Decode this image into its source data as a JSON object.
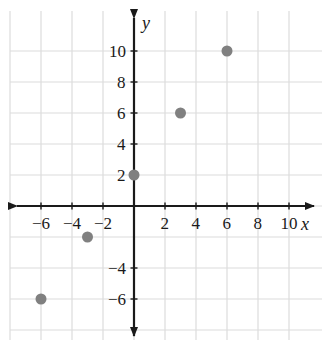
{
  "chart_data": {
    "type": "scatter",
    "title": "",
    "xlabel": "x",
    "ylabel": "y",
    "grid": true,
    "grid_step": 2,
    "legend": "none",
    "xlim": [
      -8,
      11
    ],
    "ylim": [
      -8,
      11
    ],
    "x_tick_labels": [
      "−6",
      "−4",
      "−2",
      "2",
      "4",
      "6",
      "8",
      "10"
    ],
    "x_tick_values": [
      -6,
      -4,
      -2,
      2,
      4,
      6,
      8,
      10
    ],
    "y_tick_labels": [
      "10",
      "8",
      "6",
      "4",
      "2",
      "−4",
      "−6"
    ],
    "y_tick_values": [
      10,
      8,
      6,
      4,
      2,
      -4,
      -6
    ],
    "points": [
      {
        "x": 0,
        "y": 2
      },
      {
        "x": 3,
        "y": 6
      },
      {
        "x": 6,
        "y": 10
      },
      {
        "x": -3,
        "y": -2
      },
      {
        "x": -6,
        "y": -6
      }
    ],
    "point_color": "#808080",
    "axis_color": "#1a1a1a",
    "grid_color": "#dcdcdc",
    "background_color": "#ffffff"
  },
  "geometry": {
    "origin_x": 134,
    "origin_y": 206,
    "unit_px": 15.5,
    "point_radius": 5.5,
    "plot_left": 10,
    "plot_top": 11,
    "plot_right": 322,
    "plot_bottom": 340
  }
}
